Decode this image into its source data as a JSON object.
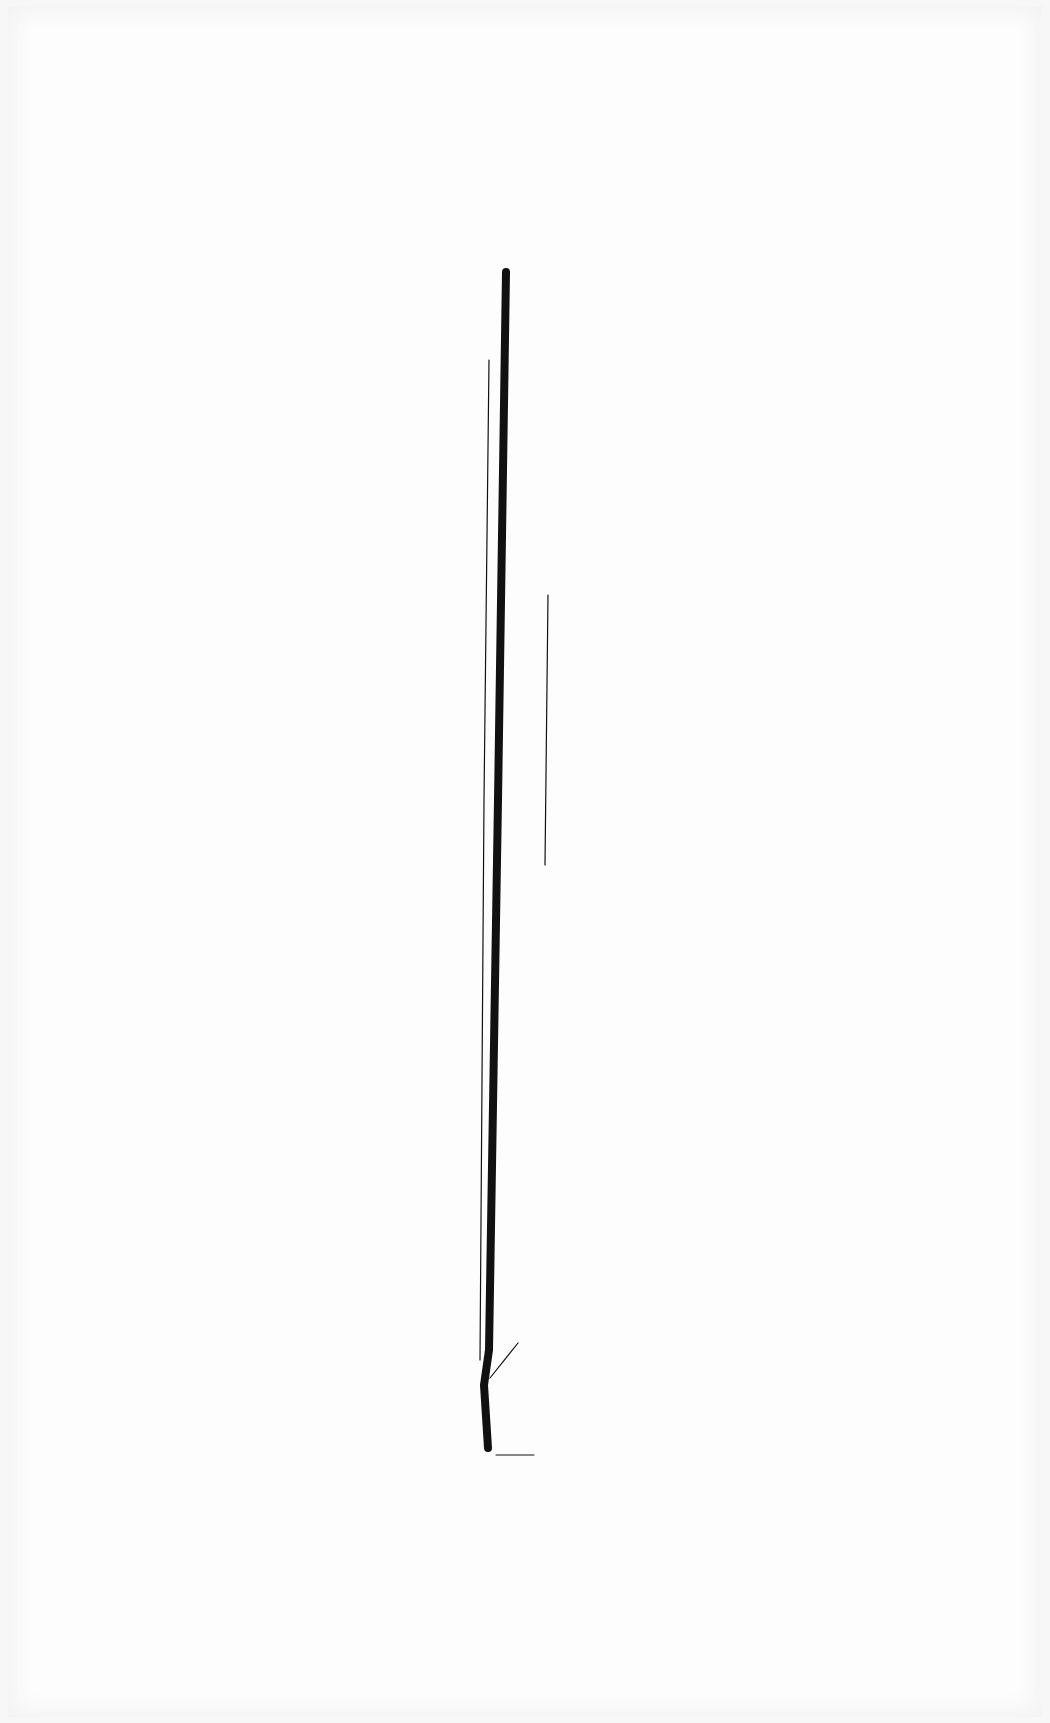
{
  "artwork": {
    "background_color": "#fdfdfd",
    "ink_color": "#111111",
    "strokes": [
      {
        "name": "main-stroke",
        "points": [
          [
            506,
            272
          ],
          [
            498,
            800
          ],
          [
            489,
            1350
          ],
          [
            484,
            1385
          ],
          [
            488,
            1448
          ]
        ],
        "width": 8
      },
      {
        "name": "left-hairline",
        "points": [
          [
            489,
            360
          ],
          [
            484,
            800
          ],
          [
            480,
            1360
          ]
        ],
        "width": 1.2
      },
      {
        "name": "right-hairline",
        "points": [
          [
            548,
            595
          ],
          [
            545,
            865
          ]
        ],
        "width": 1.2
      },
      {
        "name": "diagonal-hairline",
        "points": [
          [
            490,
            1378
          ],
          [
            518,
            1343
          ]
        ],
        "width": 1.2
      },
      {
        "name": "base-marks",
        "points": [
          [
            496,
            1455
          ],
          [
            534,
            1455
          ]
        ],
        "width": 1
      }
    ]
  }
}
